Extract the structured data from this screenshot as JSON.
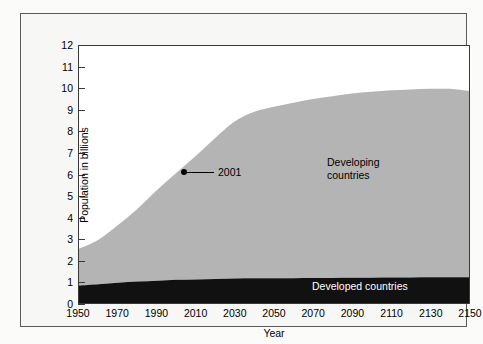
{
  "chart_data": {
    "type": "area",
    "title": "",
    "subtitle": "",
    "xlabel": "Year",
    "ylabel": "Population in billions",
    "xlim": [
      1950,
      2150
    ],
    "ylim": [
      0,
      12
    ],
    "grid": false,
    "stacked": true,
    "legend_position": "inline-annotations",
    "x_ticks": [
      1950,
      1970,
      1990,
      2010,
      2030,
      2050,
      2070,
      2090,
      2110,
      2130,
      2150
    ],
    "y_ticks": [
      0,
      1,
      2,
      3,
      4,
      5,
      6,
      7,
      8,
      9,
      10,
      11,
      12
    ],
    "x": [
      1950,
      1960,
      1970,
      1980,
      1990,
      2000,
      2010,
      2020,
      2030,
      2040,
      2050,
      2060,
      2070,
      2080,
      2090,
      2100,
      2110,
      2120,
      2130,
      2140,
      2150
    ],
    "series": [
      {
        "name": "Developed countries",
        "color": "#111111",
        "values": [
          0.82,
          0.88,
          0.94,
          1.0,
          1.04,
          1.08,
          1.1,
          1.12,
          1.14,
          1.15,
          1.16,
          1.16,
          1.17,
          1.17,
          1.18,
          1.18,
          1.19,
          1.19,
          1.2,
          1.2,
          1.2
        ]
      },
      {
        "name": "Developing countries",
        "color": "#b4b4b4",
        "values": [
          1.71,
          2.07,
          2.7,
          3.4,
          4.24,
          5.0,
          5.78,
          6.6,
          7.35,
          7.78,
          8.0,
          8.19,
          8.35,
          8.48,
          8.6,
          8.68,
          8.74,
          8.78,
          8.8,
          8.8,
          8.7
        ]
      }
    ],
    "totals": [
      2.53,
      2.95,
      3.64,
      4.4,
      5.28,
      6.08,
      6.88,
      7.72,
      8.49,
      8.93,
      9.16,
      9.35,
      9.52,
      9.65,
      9.78,
      9.86,
      9.93,
      9.97,
      10.0,
      10.0,
      9.9
    ],
    "annotations": [
      {
        "label": "2001",
        "x": 2001,
        "y": 6.2,
        "marker": "dot",
        "leader": true
      },
      {
        "label": "Developing countries",
        "x": 2090,
        "y": 6.3,
        "marker": "none",
        "leader": false
      },
      {
        "label": "Developed countries",
        "x": 2080,
        "y": 0.6,
        "marker": "none",
        "leader": false
      }
    ],
    "colors": {
      "developed": "#111111",
      "developing": "#b4b4b4",
      "plot_background": "#ffffff",
      "figure_background": "#f7f7f6",
      "axis": "#3a3a3a",
      "frame": "#5a5a5a",
      "text": "#000000",
      "inverse_text": "#ffffff"
    }
  },
  "axes": {
    "y_title": "Population in billions",
    "x_title": "Year",
    "y_tick_labels": [
      "0",
      "1",
      "2",
      "3",
      "4",
      "5",
      "6",
      "7",
      "8",
      "9",
      "10",
      "11",
      "12"
    ],
    "x_tick_labels": [
      "1950",
      "1970",
      "1990",
      "2010",
      "2030",
      "2050",
      "2070",
      "2090",
      "2110",
      "2130",
      "2150"
    ]
  },
  "labels": {
    "annotation_2001": "2001",
    "developing_line1": "Developing",
    "developing_line2": "countries",
    "developed": "Developed countries"
  }
}
